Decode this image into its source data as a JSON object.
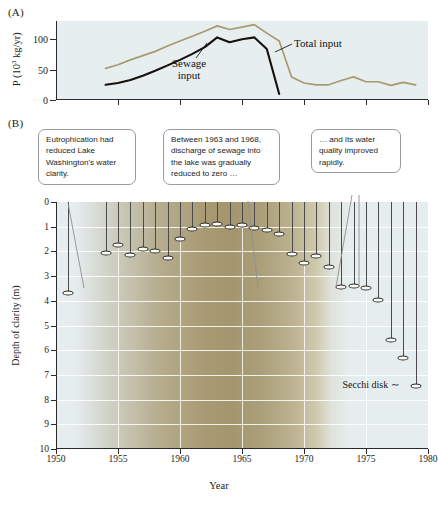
{
  "figure": {
    "panelA_letter": "(A)",
    "panelB_letter": "(B)"
  },
  "callouts": [
    {
      "id": "callout-eutrophication",
      "text": "Eutrophication had reduced Lake Washington's water clarity."
    },
    {
      "id": "callout-sewage-reduction",
      "text": "Between 1963 and 1968, discharge of sewage into the lake was gradually reduced to zero …"
    },
    {
      "id": "callout-water-quality",
      "text": "… and its water quality improved rapidly."
    }
  ],
  "annotations": {
    "secchi_disk": "Secchi disk"
  },
  "chart_data": [
    {
      "id": "panel-a",
      "type": "line",
      "title": "(A)",
      "xlabel": "",
      "ylabel": "P (10³ kg/yr)",
      "xlim": [
        1950,
        1980
      ],
      "ylim": [
        0,
        130
      ],
      "yticks": [
        0,
        50,
        100
      ],
      "ytick_labels": [
        "0",
        "50",
        "100"
      ],
      "xticks": [
        1955,
        1960,
        1965,
        1970,
        1975,
        1980
      ],
      "grid": false,
      "legend_position": "inline-labels",
      "series": [
        {
          "name": "Total input",
          "color": "#a79a6e",
          "x": [
            1954,
            1955,
            1956,
            1957,
            1958,
            1959,
            1960,
            1961,
            1962,
            1963,
            1964,
            1965,
            1966,
            1967,
            1968,
            1969,
            1970,
            1971,
            1972,
            1973,
            1974,
            1975,
            1976,
            1977,
            1978,
            1979
          ],
          "values": [
            52,
            58,
            66,
            73,
            80,
            89,
            97,
            105,
            113,
            122,
            116,
            120,
            124,
            110,
            97,
            38,
            28,
            25,
            25,
            32,
            38,
            30,
            30,
            24,
            29,
            25
          ]
        },
        {
          "name": "Sewage input",
          "color": "#16100c",
          "x": [
            1954,
            1955,
            1956,
            1957,
            1958,
            1959,
            1960,
            1961,
            1962,
            1963,
            1964,
            1965,
            1966,
            1967,
            1968
          ],
          "values": [
            25,
            28,
            33,
            40,
            48,
            57,
            66,
            76,
            87,
            103,
            95,
            100,
            103,
            84,
            10
          ]
        }
      ],
      "series_labels": [
        {
          "name": "Total input",
          "text": "Total input"
        },
        {
          "name": "Sewage input",
          "text": "Sewage\ninput"
        }
      ]
    },
    {
      "id": "panel-b",
      "type": "scatter",
      "title": "(B)",
      "xlabel": "Year",
      "ylabel": "Depth of clarity (m)",
      "xlim": [
        1950,
        1980
      ],
      "ylim": [
        0,
        10
      ],
      "y_inverted": true,
      "yticks": [
        0,
        1,
        2,
        3,
        4,
        5,
        6,
        7,
        8,
        9,
        10
      ],
      "ytick_labels": [
        "0",
        "1",
        "2",
        "3",
        "4",
        "5",
        "6",
        "7",
        "8",
        "9",
        "10"
      ],
      "xticks": [
        1950,
        1955,
        1960,
        1965,
        1970,
        1975,
        1980
      ],
      "xtick_labels": [
        "1950",
        "1955",
        "1960",
        "1965",
        "1970",
        "1975",
        "1980"
      ],
      "grid": true,
      "marker": "secchi-disk",
      "series": [
        {
          "name": "Secchi disk depth",
          "x": [
            1951,
            1954,
            1955,
            1956,
            1957,
            1958,
            1959,
            1960,
            1961,
            1962,
            1963,
            1964,
            1965,
            1966,
            1967,
            1968,
            1969,
            1970,
            1971,
            1972,
            1973,
            1974,
            1975,
            1976,
            1977,
            1978,
            1979
          ],
          "values": [
            3.7,
            2.05,
            1.75,
            2.15,
            1.9,
            2.0,
            2.25,
            1.5,
            1.1,
            0.95,
            0.9,
            1.0,
            0.95,
            1.05,
            1.15,
            1.3,
            2.1,
            2.45,
            2.2,
            2.65,
            3.45,
            3.4,
            3.5,
            3.95,
            5.6,
            6.3,
            7.45,
            7.75
          ]
        }
      ]
    }
  ]
}
